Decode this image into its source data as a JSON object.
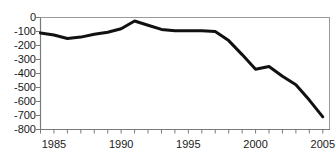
{
  "chart_data": {
    "type": "line",
    "title": "",
    "subtitle": "",
    "xlabel": "",
    "ylabel": "",
    "xlim": [
      1984,
      2005.5
    ],
    "ylim": [
      -800,
      0
    ],
    "grid": false,
    "legend": null,
    "legend_position": "none",
    "line_color": "#111111",
    "line_width_px": 3,
    "axis_color": "#808080",
    "background": "#ffffff",
    "x_ticks": [
      1984,
      1985,
      1986,
      1987,
      1988,
      1989,
      1990,
      1991,
      1992,
      1993,
      1994,
      1995,
      1996,
      1997,
      1998,
      1999,
      2000,
      2001,
      2002,
      2003,
      2004,
      2005
    ],
    "x_tick_labels": [
      {
        "value": 1985,
        "label": "1985"
      },
      {
        "value": 1990,
        "label": "1990"
      },
      {
        "value": 1995,
        "label": "1995"
      },
      {
        "value": 2000,
        "label": "2000"
      },
      {
        "value": 2005,
        "label": "2005"
      }
    ],
    "y_ticks": [
      0,
      -100,
      -200,
      -300,
      -400,
      -500,
      -600,
      -700,
      -800
    ],
    "y_tick_labels": [
      "0",
      "-100",
      "-200",
      "-300",
      "-400",
      "-500",
      "-600",
      "-700",
      "-800"
    ],
    "series": [
      {
        "name": "balance",
        "x": [
          1984,
          1985,
          1986,
          1987,
          1988,
          1989,
          1990,
          1991,
          1992,
          1993,
          1994,
          1995,
          1996,
          1997,
          1998,
          1999,
          2000,
          2001,
          2002,
          2003,
          2004,
          2005
        ],
        "values": [
          -110,
          -125,
          -150,
          -140,
          -120,
          -105,
          -80,
          -25,
          -55,
          -85,
          -95,
          -95,
          -95,
          -100,
          -165,
          -265,
          -370,
          -350,
          -420,
          -480,
          -590,
          -710
        ]
      }
    ],
    "annotations": []
  }
}
